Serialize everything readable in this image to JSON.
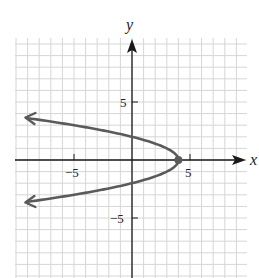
{
  "chart_data": {
    "type": "line",
    "title": "",
    "equation": "x = 4 - y^2",
    "xlabel": "x",
    "ylabel": "y",
    "xlim": [
      -10,
      10
    ],
    "ylim": [
      -10,
      10
    ],
    "grid": true,
    "x_ticks": [
      {
        "value": -5,
        "label": "−5"
      },
      {
        "value": 5,
        "label": "5"
      }
    ],
    "y_ticks": [
      {
        "value": 5,
        "label": "5"
      },
      {
        "value": -5,
        "label": "−5"
      }
    ],
    "vertex": {
      "x": 4,
      "y": 0
    },
    "series": [
      {
        "name": "parabola",
        "color": "#5a5a5a",
        "x": [
          -10,
          -5,
          -2.25,
          0,
          2,
          3,
          4,
          3,
          2,
          0,
          -2.25,
          -5,
          -10
        ],
        "y": [
          3.74,
          3,
          2.5,
          2,
          1.41,
          1,
          0,
          -1,
          -1.41,
          -2,
          -2.5,
          -3,
          -3.74
        ]
      }
    ],
    "legend": null
  },
  "labels": {
    "x_axis": "x",
    "y_axis": "y",
    "x_tick_neg5": "−5",
    "x_tick_5": "5",
    "y_tick_5": "5",
    "y_tick_neg5": "−5"
  },
  "colors": {
    "grid": "#d6d6d6",
    "axis": "#1a1a1a",
    "curve": "#5a5a5a"
  }
}
